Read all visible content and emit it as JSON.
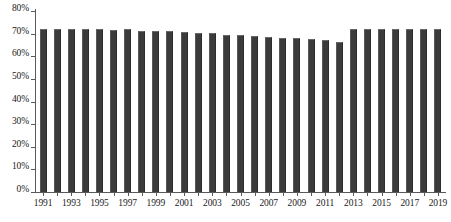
{
  "chart_data": {
    "type": "bar",
    "title": "",
    "subtitle": "",
    "xlabel": "",
    "ylabel": "",
    "ylim": [
      0,
      80
    ],
    "ytick_labels": [
      "0%",
      "10%",
      "20%",
      "30%",
      "40%",
      "50%",
      "60%",
      "70%",
      "80%"
    ],
    "ytick_values": [
      0,
      10,
      20,
      30,
      40,
      50,
      60,
      70,
      80
    ],
    "grid": false,
    "legend": null,
    "legend_position": "none",
    "bar_color": "#3b3b3b",
    "axis_color": "#5a5a5a",
    "background_color": "#ffffff",
    "categories": [
      "1991",
      "1992",
      "1993",
      "1994",
      "1995",
      "1996",
      "1997",
      "1998",
      "1999",
      "2000",
      "2001",
      "2002",
      "2003",
      "2004",
      "2005",
      "2006",
      "2007",
      "2008",
      "2009",
      "2010",
      "2011",
      "2012",
      "2013",
      "2014",
      "2015",
      "2016",
      "2017",
      "2018",
      "2019"
    ],
    "xtick_labels": [
      "1991",
      "1993",
      "1995",
      "1997",
      "1999",
      "2001",
      "2003",
      "2005",
      "2007",
      "2009",
      "2011",
      "2013",
      "2015",
      "2017",
      "2019"
    ],
    "values": [
      72.0,
      72.0,
      72.1,
      71.9,
      72.0,
      71.6,
      72.1,
      71.0,
      71.3,
      71.1,
      70.8,
      70.5,
      70.1,
      69.6,
      69.2,
      69.0,
      68.4,
      68.2,
      68.0,
      67.6,
      67.0,
      66.5,
      72.2,
      72.0,
      72.2,
      71.9,
      72.2,
      72.0,
      72.0
    ]
  }
}
